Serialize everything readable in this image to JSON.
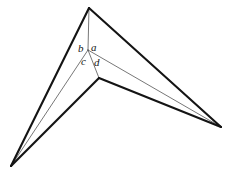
{
  "figure": {
    "background_color": "#ffffff",
    "ink_color": "#141414",
    "thin_ink_color": "#3c3c3c",
    "canvas": {
      "width": 228,
      "height": 171
    },
    "vertices": {
      "apex": {
        "name": "top-apex",
        "x": 89,
        "y": 8
      },
      "left": {
        "name": "bottom-left-vertex",
        "x": 11,
        "y": 166
      },
      "right": {
        "name": "right-vertex",
        "x": 221,
        "y": 127
      },
      "notch": {
        "name": "inner-notch-vertex",
        "x": 99,
        "y": 78
      },
      "node": {
        "name": "center-node",
        "x": 88,
        "y": 50
      }
    },
    "thick_edges": [
      {
        "name": "edge-apex-to-left",
        "from": "apex",
        "to": "left"
      },
      {
        "name": "edge-apex-to-right",
        "from": "apex",
        "to": "right"
      },
      {
        "name": "edge-left-to-notch",
        "from": "left",
        "to": "notch"
      },
      {
        "name": "edge-notch-to-right",
        "from": "notch",
        "to": "right"
      }
    ],
    "thin_edges": [
      {
        "name": "ray-node-to-apex",
        "from": "node",
        "to": "apex"
      },
      {
        "name": "ray-node-to-left",
        "from": "node",
        "to": "left"
      },
      {
        "name": "ray-node-to-right",
        "from": "node",
        "to": "right"
      },
      {
        "name": "ray-node-to-notch",
        "from": "node",
        "to": "notch"
      }
    ],
    "labels": [
      {
        "name": "label-b",
        "text": "b",
        "x": 78,
        "y": 43
      },
      {
        "name": "label-a",
        "text": "a",
        "x": 91,
        "y": 42
      },
      {
        "name": "label-c",
        "text": "c",
        "x": 81,
        "y": 56
      },
      {
        "name": "label-d",
        "text": "d",
        "x": 94,
        "y": 57
      }
    ]
  }
}
